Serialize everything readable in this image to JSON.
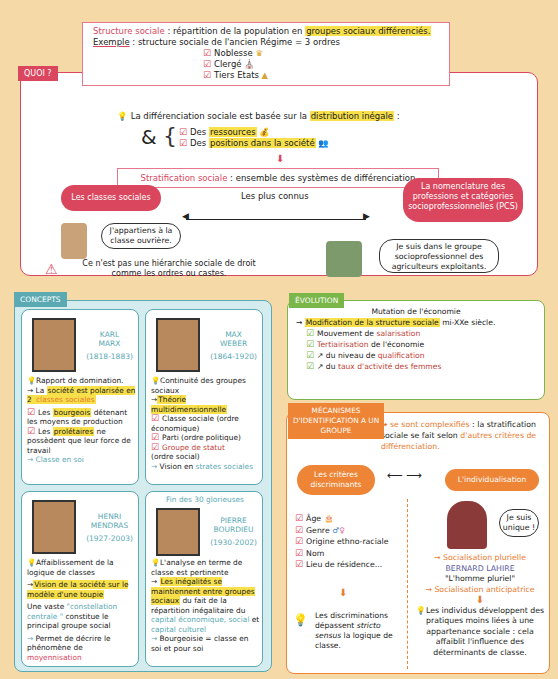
{
  "structure": {
    "term": "Structure sociale",
    "definition_pre": " : répartition de la population en ",
    "definition_hl": "groupes sociaux différenciés.",
    "example_label": "Exemple",
    "example_text": " : structure sociale de l'ancien Régime = 3 ordres",
    "orders": [
      "Noblesse",
      "Clergé",
      "Tiers Etats"
    ]
  },
  "quoi": {
    "label": "QUOI ?",
    "differentiation_pre": "La différenciation sociale est basée sur la ",
    "differentiation_hl": "distribution inégale",
    "differentiation_post": " :",
    "ampersand": "&",
    "items": [
      {
        "pre": "Des ",
        "hl": "ressources"
      },
      {
        "pre": "Des ",
        "hl": "positions dans la société"
      }
    ],
    "stratification_term": "Stratification sociale",
    "stratification_def": " : ensemble des systèmes de différenciation",
    "most_known": "Les plus connus",
    "left_bubble": "Les classes sociales",
    "right_bubble": "La nomenclature des professions et catégories socioprofessionnelles (PCS)",
    "left_speech": "J'appartiens à la classe ouvrière.",
    "right_speech": "Je suis dans le groupe socioprofessionnel des agriculteurs exploitants.",
    "warning": "Ce n'est pas une hiérarchie sociale de droit comme les ordres ou castes."
  },
  "concepts": {
    "label": "CONCEPTS",
    "cards": [
      {
        "first": "KARL",
        "last": "MARX",
        "dates": "(1818-1883)",
        "idea": "Rapport de domination.",
        "arrow_pre": "La ",
        "arrow_hl": "société est polarisée en 2",
        "arrow_colored": " classes sociales",
        "p1_pre": "Les ",
        "p1_hl": "bourgeois",
        "p1_post": " détenant les moyens de production",
        "p2_pre": "Les ",
        "p2_hl": "prolétaires",
        "p2_post": " ne possèdent que leur force de travail",
        "conclusion": "Classe en soi"
      },
      {
        "first": "MAX",
        "last": "WEBER",
        "dates": "(1864-1920)",
        "idea": "Continuité des groupes sociaux",
        "arrow_hl": "Théorie multidimensionnelle",
        "items": [
          "Classe sociale (ordre économique)",
          "Parti (ordre politique)",
          "Groupe de statut",
          "(ordre social)"
        ],
        "conclusion_pre": "Vision en ",
        "conclusion_colored": "strates sociales"
      },
      {
        "first": "HENRI",
        "last": "MENDRAS",
        "dates": "(1927-2003)",
        "idea": "Affaiblissement de la logique de classes",
        "arrow_hl": "Vision de la société sur le modèle d'une toupie",
        "text_pre": "Une vaste ",
        "text_colored": "\"constellation centrale \"",
        "text_post": " constitue le principal groupe social",
        "conclusion_pre": "Permet de décrire le phénomène de ",
        "conclusion_colored": "moyennisation"
      },
      {
        "header": "Fin des 30 glorieuses",
        "first": "PIERRE",
        "last": "BOURDIEU",
        "dates": "(1930-2002)",
        "idea": "L'analyse en terme de classe est pertinente",
        "arrow_hl": "Les inégalités se maintiennent entre groupes sociaux",
        "text_post": " du fait de la répartition inégalitaire du ",
        "cap1": "capital économique, social",
        "text_and": " et ",
        "cap2": "capital culturel",
        "conclusion": "Bourgeoisie = classe en soi et pour soi"
      }
    ]
  },
  "evolution": {
    "label": "ÉVOLUTION",
    "title": "Mutation de l'économie",
    "arrow_hl": "Modification de la structure sociale",
    "arrow_post": " mi-XXe siècle.",
    "items": [
      {
        "pre": "Mouvement de ",
        "colored": "salarisation",
        "post": ""
      },
      {
        "pre": "",
        "colored": "Tertiairisation",
        "post": " de l'économie"
      },
      {
        "pre": "du niveau de ",
        "colored": "qualification",
        "post": ""
      },
      {
        "pre": "du ",
        "colored": "taux d'activité des femmes",
        "post": ""
      }
    ]
  },
  "mecanismes": {
    "label": "MÉCANISMES D'IDENTIFICATION A UN GROUPE",
    "intro_colored": "se sont complexifiés",
    "intro_post": " : la stratification sociale se fait selon ",
    "intro_colored2": "d'autres critères de différenciation.",
    "left_bubble": "Les critères discriminants",
    "right_bubble": "L'individualisation",
    "criteria": [
      "Âge",
      "Genre",
      "Origine ethno-raciale",
      "Nom",
      "Lieu de résidence..."
    ],
    "left_conclusion_pre": "Les discriminations dépassent ",
    "left_conclusion_it": "stricto sensus",
    "left_conclusion_post": " la logique de classe.",
    "speech": "Je suis unique !",
    "socialisation": "Socialisation plurielle",
    "author": "BERNARD LAHIRE",
    "book": "\"L'homme pluriel\"",
    "anticipatrice": "Socialisation anticipatrice",
    "right_conclusion": "Les individus développent des pratiques moins liées à une appartenance sociale : cela affaiblit l'influence des déterminants de classe."
  }
}
